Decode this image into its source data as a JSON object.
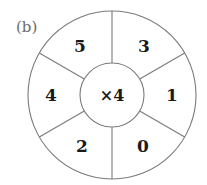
{
  "figure": {
    "label": "(b)",
    "center_operation": "×4",
    "segments": [
      {
        "position": "top-left",
        "value": "5"
      },
      {
        "position": "top-right",
        "value": "3"
      },
      {
        "position": "right",
        "value": "1"
      },
      {
        "position": "bottom-right",
        "value": "0"
      },
      {
        "position": "bottom-left",
        "value": "2"
      },
      {
        "position": "left",
        "value": "4"
      }
    ]
  },
  "colors": {
    "line": "#7a7a7a",
    "text": "#1a1a1a",
    "label": "#6b6b6b"
  }
}
